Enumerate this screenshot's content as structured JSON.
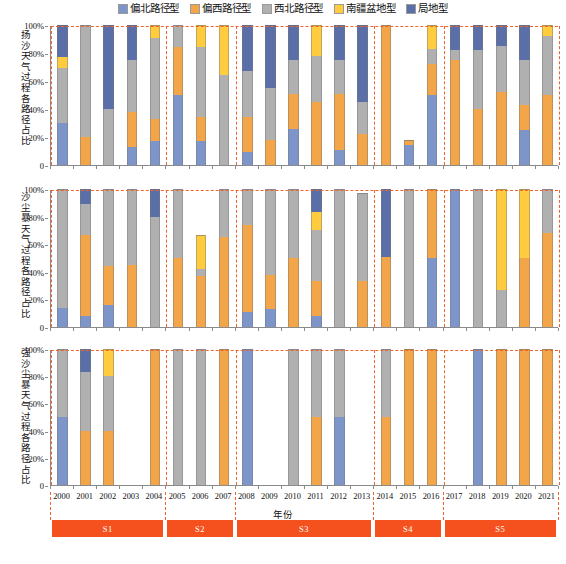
{
  "legend": {
    "position": "top-center",
    "items": [
      {
        "label": "偏北路径型",
        "color": "#7d95c8",
        "key": "north"
      },
      {
        "label": "偏西路径型",
        "color": "#f3a54a",
        "key": "west"
      },
      {
        "label": "西北路径型",
        "color": "#b0b0b0",
        "key": "northwest"
      },
      {
        "label": "南疆盆地型",
        "color": "#ffcb3f",
        "key": "basin"
      },
      {
        "label": "局地型",
        "color": "#5a6fa8",
        "key": "local"
      }
    ]
  },
  "axes": {
    "xlabel": "年份",
    "ytick_labels": [
      "0",
      "20%",
      "40%",
      "60%",
      "80%",
      "100%"
    ],
    "ytick_values": [
      0,
      20,
      40,
      60,
      80,
      100
    ],
    "ylim": [
      0,
      100
    ],
    "years": [
      "2000",
      "2001",
      "2002",
      "2003",
      "2004",
      "2005",
      "2006",
      "2007",
      "2008",
      "2009",
      "2010",
      "2011",
      "2012",
      "2013",
      "2014",
      "2015",
      "2016",
      "2017",
      "2018",
      "2019",
      "2020",
      "2021"
    ]
  },
  "stages": [
    {
      "label": "S1",
      "start_year": "2000",
      "end_year": "2004"
    },
    {
      "label": "S2",
      "start_year": "2005",
      "end_year": "2007"
    },
    {
      "label": "S3",
      "start_year": "2008",
      "end_year": "2013"
    },
    {
      "label": "S4",
      "start_year": "2014",
      "end_year": "2016"
    },
    {
      "label": "S5",
      "start_year": "2017",
      "end_year": "2021"
    }
  ],
  "chart_data": [
    {
      "type": "bar",
      "panel": "top",
      "title": "",
      "ylabel": "扬沙天气过程各路径占比",
      "xlabel": "年份",
      "ylim": [
        0,
        100
      ],
      "grid": false,
      "stacked": true,
      "categories": [
        "2000",
        "2001",
        "2002",
        "2003",
        "2004",
        "2005",
        "2006",
        "2007",
        "2008",
        "2009",
        "2010",
        "2011",
        "2012",
        "2013",
        "2014",
        "2015",
        "2016",
        "2017",
        "2018",
        "2019",
        "2020",
        "2021"
      ],
      "series": [
        {
          "name": "偏北路径型",
          "values": [
            30,
            0,
            0,
            13,
            17,
            50,
            17,
            0,
            0,
            0,
            0,
            0,
            0,
            0,
            0,
            0,
            12,
            25,
            0,
            0,
            0,
            0
          ]
        },
        {
          "name": "偏西路径型",
          "values": [
            0,
            20,
            0,
            25,
            16,
            34,
            17,
            0,
            9,
            18,
            26,
            45,
            40,
            22,
            100,
            50,
            33,
            26,
            29,
            18,
            0,
            50
          ]
        },
        {
          "name": "偏北路径型_2",
          "values": [
            0,
            0,
            0,
            0,
            0,
            0,
            0,
            0,
            0,
            0,
            0,
            0,
            0,
            0,
            0,
            0,
            0,
            0,
            0,
            0,
            0,
            0
          ]
        }
      ],
      "bars": [
        {
          "year": "2000",
          "north": 30,
          "west": 0,
          "northwest": 39,
          "basin": 8,
          "local": 23
        },
        {
          "year": "2001",
          "north": 0,
          "west": 20,
          "northwest": 80,
          "basin": 0,
          "local": 0
        },
        {
          "year": "2002",
          "north": 0,
          "west": 0,
          "northwest": 40,
          "basin": 0,
          "local": 60
        },
        {
          "year": "2003",
          "north": 13,
          "west": 25,
          "northwest": 37,
          "basin": 0,
          "local": 25
        },
        {
          "year": "2004",
          "north": 17,
          "west": 16,
          "northwest": 58,
          "basin": 9,
          "local": 0
        },
        {
          "year": "2005",
          "north": 50,
          "west": 34,
          "northwest": 16,
          "basin": 0,
          "local": 0
        },
        {
          "year": "2006",
          "north": 17,
          "west": 17,
          "northwest": 50,
          "basin": 16,
          "local": 0
        },
        {
          "year": "2007",
          "north": 0,
          "west": 0,
          "northwest": 64,
          "basin": 36,
          "local": 0
        },
        {
          "year": "2008",
          "north": 9,
          "west": 25,
          "northwest": 33,
          "basin": 0,
          "local": 33
        },
        {
          "year": "2009",
          "north": 0,
          "west": 18,
          "northwest": 37,
          "basin": 0,
          "local": 45
        },
        {
          "year": "2010",
          "north": 26,
          "west": 25,
          "northwest": 24,
          "basin": 0,
          "local": 25
        },
        {
          "year": "2011",
          "north": 0,
          "west": 45,
          "northwest": 33,
          "basin": 22,
          "local": 0
        },
        {
          "year": "2012",
          "north": 11,
          "west": 40,
          "northwest": 24,
          "basin": 0,
          "local": 25
        },
        {
          "year": "2013",
          "north": 0,
          "west": 22,
          "northwest": 23,
          "basin": 0,
          "local": 55
        },
        {
          "year": "2014",
          "north": 0,
          "west": 100,
          "northwest": 0,
          "basin": 0,
          "local": 0
        },
        {
          "year": "2015",
          "north": 14,
          "west": 4,
          "northwest": 0,
          "basin": 0,
          "local": 0
        },
        {
          "year": "2016",
          "north": 50,
          "west": 22,
          "northwest": 11,
          "basin": 17,
          "local": 0
        },
        {
          "year": "2017",
          "north": 0,
          "west": 75,
          "northwest": 7,
          "basin": 0,
          "local": 18
        },
        {
          "year": "2018",
          "north": 0,
          "west": 40,
          "northwest": 42,
          "basin": 0,
          "local": 18
        },
        {
          "year": "2019",
          "north": 0,
          "west": 52,
          "northwest": 33,
          "basin": 0,
          "local": 15
        },
        {
          "year": "2020",
          "north": 25,
          "west": 18,
          "northwest": 32,
          "basin": 0,
          "local": 25
        },
        {
          "year": "2021",
          "north": 0,
          "west": 50,
          "northwest": 42,
          "basin": 8,
          "local": 0
        }
      ]
    },
    {
      "type": "bar",
      "panel": "middle",
      "title": "",
      "ylabel": "沙尘暴天气过程各路径占比",
      "xlabel": "年份",
      "ylim": [
        0,
        100
      ],
      "grid": false,
      "stacked": true,
      "categories": [
        "2000",
        "2001",
        "2002",
        "2003",
        "2004",
        "2005",
        "2006",
        "2007",
        "2008",
        "2009",
        "2010",
        "2011",
        "2012",
        "2013",
        "2014",
        "2015",
        "2016",
        "2017",
        "2018",
        "2019",
        "2020",
        "2021"
      ],
      "bars": [
        {
          "year": "2000",
          "north": 14,
          "west": 0,
          "northwest": 86,
          "basin": 0,
          "local": 0
        },
        {
          "year": "2001",
          "north": 8,
          "west": 59,
          "northwest": 22,
          "basin": 0,
          "local": 11
        },
        {
          "year": "2002",
          "north": 16,
          "west": 28,
          "northwest": 56,
          "basin": 0,
          "local": 0
        },
        {
          "year": "2003",
          "north": 0,
          "west": 45,
          "northwest": 55,
          "basin": 0,
          "local": 0
        },
        {
          "year": "2004",
          "north": 0,
          "west": 0,
          "northwest": 80,
          "basin": 0,
          "local": 20
        },
        {
          "year": "2005",
          "north": 0,
          "west": 50,
          "northwest": 50,
          "basin": 0,
          "local": 0
        },
        {
          "year": "2006",
          "north": 0,
          "west": 37,
          "northwest": 5,
          "basin": 25,
          "local": 0
        },
        {
          "year": "2007",
          "north": 0,
          "west": 65,
          "northwest": 35,
          "basin": 0,
          "local": 0
        },
        {
          "year": "2008",
          "north": 11,
          "west": 63,
          "northwest": 26,
          "basin": 0,
          "local": 0
        },
        {
          "year": "2009",
          "north": 13,
          "west": 25,
          "northwest": 62,
          "basin": 0,
          "local": 0
        },
        {
          "year": "2010",
          "north": 0,
          "west": 50,
          "northwest": 50,
          "basin": 0,
          "local": 0
        },
        {
          "year": "2011",
          "north": 8,
          "west": 25,
          "northwest": 37,
          "basin": 13,
          "local": 17
        },
        {
          "year": "2012",
          "north": 0,
          "west": 0,
          "northwest": 100,
          "basin": 0,
          "local": 0
        },
        {
          "year": "2013",
          "north": 0,
          "west": 33,
          "northwest": 64,
          "basin": 0,
          "local": 0
        },
        {
          "year": "2014",
          "north": 0,
          "west": 51,
          "northwest": 0,
          "basin": 0,
          "local": 49
        },
        {
          "year": "2015",
          "north": 0,
          "west": 0,
          "northwest": 100,
          "basin": 0,
          "local": 0
        },
        {
          "year": "2016",
          "north": 50,
          "west": 50,
          "northwest": 0,
          "basin": 0,
          "local": 0
        },
        {
          "year": "2017",
          "north": 100,
          "west": 0,
          "northwest": 0,
          "basin": 0,
          "local": 0
        },
        {
          "year": "2018",
          "north": 0,
          "west": 0,
          "northwest": 100,
          "basin": 0,
          "local": 0
        },
        {
          "year": "2019",
          "north": 0,
          "west": 0,
          "northwest": 27,
          "basin": 73,
          "local": 0
        },
        {
          "year": "2020",
          "north": 0,
          "west": 50,
          "northwest": 0,
          "basin": 50,
          "local": 0
        },
        {
          "year": "2021",
          "north": 0,
          "west": 68,
          "northwest": 32,
          "basin": 0,
          "local": 0
        }
      ]
    },
    {
      "type": "bar",
      "panel": "bottom",
      "title": "",
      "ylabel": "强沙尘暴天气过程各路径占比",
      "xlabel": "年份",
      "ylim": [
        0,
        100
      ],
      "grid": false,
      "stacked": true,
      "categories": [
        "2000",
        "2001",
        "2002",
        "2003",
        "2004",
        "2005",
        "2006",
        "2007",
        "2008",
        "2009",
        "2010",
        "2011",
        "2012",
        "2013",
        "2014",
        "2015",
        "2016",
        "2017",
        "2018",
        "2019",
        "2020",
        "2021"
      ],
      "bars": [
        {
          "year": "2000",
          "north": 50,
          "west": 0,
          "northwest": 50,
          "basin": 0,
          "local": 0
        },
        {
          "year": "2001",
          "north": 0,
          "west": 40,
          "northwest": 43,
          "basin": 0,
          "local": 17
        },
        {
          "year": "2002",
          "north": 0,
          "west": 40,
          "northwest": 40,
          "basin": 20,
          "local": 0
        },
        {
          "year": "2003",
          "north": 0,
          "west": 0,
          "northwest": 0,
          "basin": 0,
          "local": 0
        },
        {
          "year": "2004",
          "north": 0,
          "west": 100,
          "northwest": 0,
          "basin": 0,
          "local": 0
        },
        {
          "year": "2005",
          "north": 0,
          "west": 0,
          "northwest": 100,
          "basin": 0,
          "local": 0
        },
        {
          "year": "2006",
          "north": 0,
          "west": 0,
          "northwest": 100,
          "basin": 0,
          "local": 0
        },
        {
          "year": "2007",
          "north": 0,
          "west": 100,
          "northwest": 0,
          "basin": 0,
          "local": 0
        },
        {
          "year": "2008",
          "north": 100,
          "west": 0,
          "northwest": 0,
          "basin": 0,
          "local": 0
        },
        {
          "year": "2009",
          "north": 0,
          "west": 0,
          "northwest": 0,
          "basin": 0,
          "local": 0
        },
        {
          "year": "2010",
          "north": 0,
          "west": 0,
          "northwest": 100,
          "basin": 0,
          "local": 0
        },
        {
          "year": "2011",
          "north": 0,
          "west": 50,
          "northwest": 50,
          "basin": 0,
          "local": 0
        },
        {
          "year": "2012",
          "north": 50,
          "west": 0,
          "northwest": 50,
          "basin": 0,
          "local": 0
        },
        {
          "year": "2013",
          "north": 0,
          "west": 0,
          "northwest": 0,
          "basin": 0,
          "local": 0
        },
        {
          "year": "2014",
          "north": 0,
          "west": 50,
          "northwest": 50,
          "basin": 0,
          "local": 0
        },
        {
          "year": "2015",
          "north": 0,
          "west": 100,
          "northwest": 0,
          "basin": 0,
          "local": 0
        },
        {
          "year": "2016",
          "north": 0,
          "west": 100,
          "northwest": 0,
          "basin": 0,
          "local": 0
        },
        {
          "year": "2017",
          "north": 0,
          "west": 0,
          "northwest": 0,
          "basin": 0,
          "local": 0
        },
        {
          "year": "2018",
          "north": 100,
          "west": 0,
          "northwest": 0,
          "basin": 0,
          "local": 0
        },
        {
          "year": "2019",
          "north": 0,
          "west": 100,
          "northwest": 0,
          "basin": 0,
          "local": 0
        },
        {
          "year": "2020",
          "north": 0,
          "west": 100,
          "northwest": 0,
          "basin": 0,
          "local": 0
        },
        {
          "year": "2021",
          "north": 0,
          "west": 100,
          "northwest": 0,
          "basin": 0,
          "local": 0
        }
      ]
    }
  ]
}
